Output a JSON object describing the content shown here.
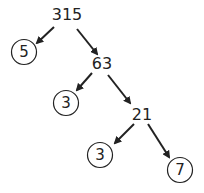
{
  "nodes": [
    {
      "id": "n315",
      "label": "315",
      "x": 67,
      "y": 15,
      "circled": false
    },
    {
      "id": "n5",
      "label": "5",
      "x": 24,
      "y": 52,
      "circled": true
    },
    {
      "id": "n63",
      "label": "63",
      "x": 102,
      "y": 64,
      "circled": false
    },
    {
      "id": "n3a",
      "label": "3",
      "x": 66,
      "y": 103,
      "circled": true
    },
    {
      "id": "n21",
      "label": "21",
      "x": 142,
      "y": 115,
      "circled": false
    },
    {
      "id": "n3b",
      "label": "3",
      "x": 100,
      "y": 155,
      "circled": true
    },
    {
      "id": "n7",
      "label": "7",
      "x": 180,
      "y": 170,
      "circled": true
    }
  ],
  "edges": [
    {
      "from": "315",
      "to": "5",
      "x1": 54,
      "y1": 27,
      "x2": 37,
      "y2": 43
    },
    {
      "from": "315",
      "to": "63",
      "x1": 77,
      "y1": 29,
      "x2": 97,
      "y2": 54
    },
    {
      "from": "63",
      "to": "3",
      "x1": 92,
      "y1": 73,
      "x2": 77,
      "y2": 90
    },
    {
      "from": "63",
      "to": "21",
      "x1": 108,
      "y1": 75,
      "x2": 130,
      "y2": 103
    },
    {
      "from": "21",
      "to": "3",
      "x1": 134,
      "y1": 124,
      "x2": 115,
      "y2": 143
    },
    {
      "from": "21",
      "to": "7",
      "x1": 148,
      "y1": 124,
      "x2": 169,
      "y2": 157
    }
  ],
  "colors": {
    "stroke": "#222222",
    "background": "#ffffff"
  }
}
